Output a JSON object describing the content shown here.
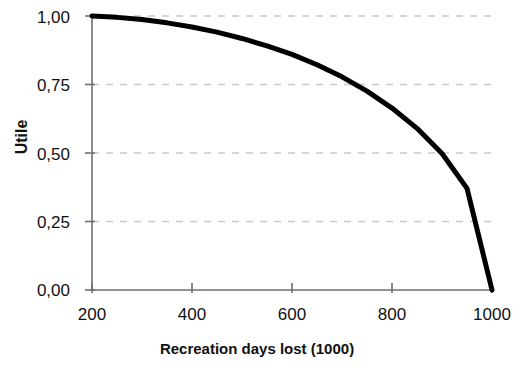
{
  "chart_data": {
    "type": "line",
    "title": "",
    "xlabel": "Recreation days lost (1000)",
    "ylabel": "Utile",
    "xlim": [
      200,
      1000
    ],
    "ylim": [
      0.0,
      1.0
    ],
    "xticks": [
      200,
      400,
      600,
      800,
      1000
    ],
    "xtick_labels": [
      "200",
      "400",
      "600",
      "800",
      "1000"
    ],
    "yticks": [
      0.0,
      0.25,
      0.5,
      0.75,
      1.0
    ],
    "ytick_labels": [
      "0,00",
      "0,25",
      "0,50",
      "0,75",
      "1,00"
    ],
    "grid": "horizontal-dashed",
    "legend": "none",
    "series": [
      {
        "name": "Utile",
        "color": "#000000",
        "line_width": 5,
        "x": [
          200,
          250,
          300,
          350,
          400,
          450,
          500,
          550,
          600,
          650,
          700,
          750,
          800,
          850,
          900,
          950,
          1000
        ],
        "y": [
          1.0,
          0.995,
          0.987,
          0.975,
          0.96,
          0.941,
          0.918,
          0.891,
          0.86,
          0.822,
          0.778,
          0.726,
          0.664,
          0.59,
          0.498,
          0.371,
          0.0
        ]
      }
    ]
  },
  "axes": {
    "y_title": "Utile",
    "x_title": "Recreation days lost (1000)"
  },
  "colors": {
    "curve": "#000000",
    "axis": "#6e6e6e",
    "grid": "#c9c9c9",
    "background": "#ffffff",
    "text": "#111111"
  }
}
